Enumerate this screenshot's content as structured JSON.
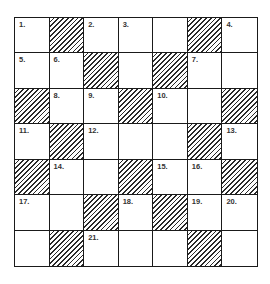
{
  "puzzle": {
    "rows": 7,
    "cols": 7,
    "cells": [
      [
        {
          "n": "1."
        },
        {
          "b": true
        },
        {
          "n": "2."
        },
        {
          "n": "3."
        },
        {},
        {
          "b": true
        },
        {
          "n": "4."
        }
      ],
      [
        {
          "n": "5."
        },
        {
          "n": "6."
        },
        {
          "b": true
        },
        {},
        {
          "b": true
        },
        {
          "n": "7."
        },
        {}
      ],
      [
        {
          "b": true
        },
        {
          "n": "8."
        },
        {
          "n": "9."
        },
        {
          "b": true
        },
        {
          "n": "10."
        },
        {},
        {
          "b": true
        }
      ],
      [
        {
          "n": "11."
        },
        {
          "b": true
        },
        {
          "n": "12."
        },
        {},
        {},
        {
          "b": true
        },
        {
          "n": "13."
        }
      ],
      [
        {
          "b": true
        },
        {
          "n": "14."
        },
        {},
        {
          "b": true
        },
        {
          "n": "15."
        },
        {
          "n": "16."
        },
        {
          "b": true
        }
      ],
      [
        {
          "n": "17."
        },
        {},
        {
          "b": true
        },
        {
          "n": "18."
        },
        {
          "b": true
        },
        {
          "n": "19."
        },
        {
          "n": "20."
        }
      ],
      [
        {},
        {
          "b": true
        },
        {
          "n": "21."
        },
        {},
        {},
        {
          "b": true
        },
        {}
      ]
    ]
  }
}
